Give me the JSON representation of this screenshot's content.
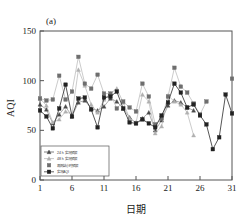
{
  "panel": {
    "label": "(a)"
  },
  "axes": {
    "ylabel": "AQI",
    "xlabel": "日期",
    "yticks": [
      "0",
      "50",
      "100",
      "150"
    ],
    "xticks": [
      "1",
      "6",
      "11",
      "16",
      "21",
      "26",
      "31"
    ]
  },
  "legend": {
    "items": [
      {
        "label": "24 h 实况预报",
        "marker": "triangle-dark",
        "color": "#4a4a4a"
      },
      {
        "label": "48 h 实况预报",
        "marker": "triangle-light",
        "color": "#b0b0b0"
      },
      {
        "label": "观测站小时预报",
        "marker": "square-gray",
        "color": "#6e6e6e"
      },
      {
        "label": "实况AQI",
        "marker": "square-dark-line",
        "color": "#222222"
      }
    ]
  },
  "chart_data": {
    "type": "line",
    "title": "",
    "subtitle": "",
    "xlabel": "日期",
    "ylabel": "AQI",
    "xlim": [
      1,
      31
    ],
    "ylim": [
      0,
      150
    ],
    "grid": false,
    "legend_position": "lower-left",
    "x": [
      1,
      2,
      3,
      4,
      5,
      6,
      7,
      8,
      9,
      10,
      11,
      12,
      13,
      14,
      15,
      16,
      17,
      18,
      19,
      20,
      21,
      22,
      23,
      24,
      25,
      26,
      27,
      28,
      29,
      30,
      31
    ],
    "series": [
      {
        "name": "24 h 实况预报",
        "marker": "triangle",
        "color": "#4a4a4a",
        "values": [
          76,
          71,
          57,
          66,
          74,
          64,
          78,
          80,
          72,
          70,
          74,
          82,
          79,
          72,
          63,
          57,
          62,
          68,
          50,
          60,
          75,
          80,
          78,
          73,
          70,
          null,
          null,
          null,
          null,
          null,
          null
        ]
      },
      {
        "name": "48 h 实况预报",
        "marker": "triangle-open",
        "color": "#b0b0b0",
        "values": [
          82,
          75,
          58,
          61,
          69,
          66,
          111,
          95,
          76,
          68,
          81,
          87,
          92,
          78,
          62,
          58,
          86,
          79,
          47,
          54,
          85,
          79,
          76,
          68,
          45,
          null,
          null,
          null,
          null,
          null,
          null
        ]
      },
      {
        "name": "观测站小时预报",
        "marker": "square",
        "color": "#6e6e6e",
        "values": [
          82,
          80,
          81,
          105,
          81,
          89,
          124,
          97,
          92,
          106,
          87,
          87,
          72,
          79,
          73,
          69,
          97,
          84,
          56,
          62,
          84,
          113,
          94,
          88,
          77,
          66,
          79,
          null,
          null,
          null,
          102
        ]
      },
      {
        "name": "实况AQI",
        "marker": "square-filled",
        "color": "#222222",
        "values": [
          70,
          64,
          52,
          72,
          96,
          64,
          82,
          83,
          71,
          53,
          83,
          84,
          89,
          72,
          58,
          57,
          61,
          57,
          53,
          65,
          78,
          97,
          88,
          73,
          76,
          65,
          56,
          31,
          43,
          86,
          67
        ]
      }
    ]
  }
}
